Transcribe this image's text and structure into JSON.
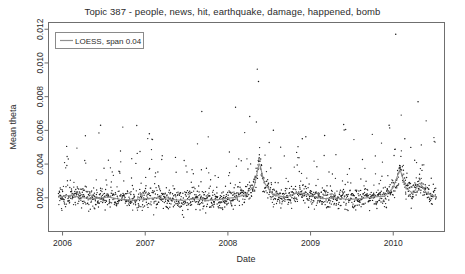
{
  "chart_data": {
    "type": "scatter",
    "title": "Topic 387 - people, news, hit, earthquake, damage, happened, bomb",
    "xlabel": "Date",
    "ylabel": "Mean theta",
    "xlim": [
      2005.83,
      2010.62
    ],
    "ylim": [
      0.0,
      0.0124
    ],
    "grid": false,
    "legend_position": "top-left",
    "legend": [
      {
        "name": "LOESS, span 0.04",
        "marker": "line",
        "color": "#909090"
      }
    ],
    "xticks": [
      2006,
      2007,
      2008,
      2009,
      2010
    ],
    "xtick_labels": [
      "2006",
      "2007",
      "2008",
      "2009",
      "2010"
    ],
    "yticks": [
      0.002,
      0.004,
      0.006,
      0.008,
      0.01,
      0.012
    ],
    "ytick_labels": [
      "0.002",
      "0.004",
      "0.006",
      "0.008",
      "0.010",
      "0.012"
    ],
    "point_color": "#1a1a1a",
    "point_size": 1.3,
    "frame_color": "#6f6f6f",
    "background": "#ffffff",
    "series": [
      {
        "name": "Mean theta daily observations",
        "type": "scatter",
        "n_points": 1650,
        "x_start": 2005.95,
        "x_end": 2010.52,
        "baseline": 0.0019,
        "noise_sd": 0.00055,
        "outlier_fraction": 0.075,
        "notable_outliers": [
          {
            "x": 2010.03,
            "y": 0.0117
          },
          {
            "x": 2008.37,
            "y": 0.0089
          },
          {
            "x": 2010.3,
            "y": 0.0077
          },
          {
            "x": 2006.46,
            "y": 0.0063
          },
          {
            "x": 2009.95,
            "y": 0.0063
          },
          {
            "x": 2008.55,
            "y": 0.006
          },
          {
            "x": 2007.05,
            "y": 0.0058
          },
          {
            "x": 2009.17,
            "y": 0.0057
          },
          {
            "x": 2008.9,
            "y": 0.0055
          },
          {
            "x": 2010.14,
            "y": 0.0055
          }
        ]
      },
      {
        "name": "LOESS, span 0.04",
        "type": "line",
        "color": "#909090",
        "span": 0.04,
        "x": [
          2005.95,
          2006.1,
          2006.25,
          2006.4,
          2006.55,
          2006.7,
          2006.85,
          2007.0,
          2007.15,
          2007.3,
          2007.45,
          2007.6,
          2007.75,
          2007.9,
          2008.05,
          2008.2,
          2008.32,
          2008.38,
          2008.44,
          2008.55,
          2008.7,
          2008.85,
          2009.0,
          2009.15,
          2009.3,
          2009.45,
          2009.6,
          2009.75,
          2009.9,
          2010.0,
          2010.08,
          2010.16,
          2010.24,
          2010.32,
          2010.4,
          2010.52
        ],
        "y": [
          0.00205,
          0.00215,
          0.002,
          0.00195,
          0.00205,
          0.0019,
          0.00185,
          0.00195,
          0.002,
          0.0019,
          0.00185,
          0.00195,
          0.00185,
          0.0019,
          0.002,
          0.00215,
          0.0027,
          0.0041,
          0.0029,
          0.00215,
          0.00205,
          0.0023,
          0.00215,
          0.00195,
          0.002,
          0.0019,
          0.00195,
          0.00205,
          0.0021,
          0.0026,
          0.0037,
          0.00255,
          0.00225,
          0.0029,
          0.0023,
          0.00205
        ]
      }
    ]
  }
}
